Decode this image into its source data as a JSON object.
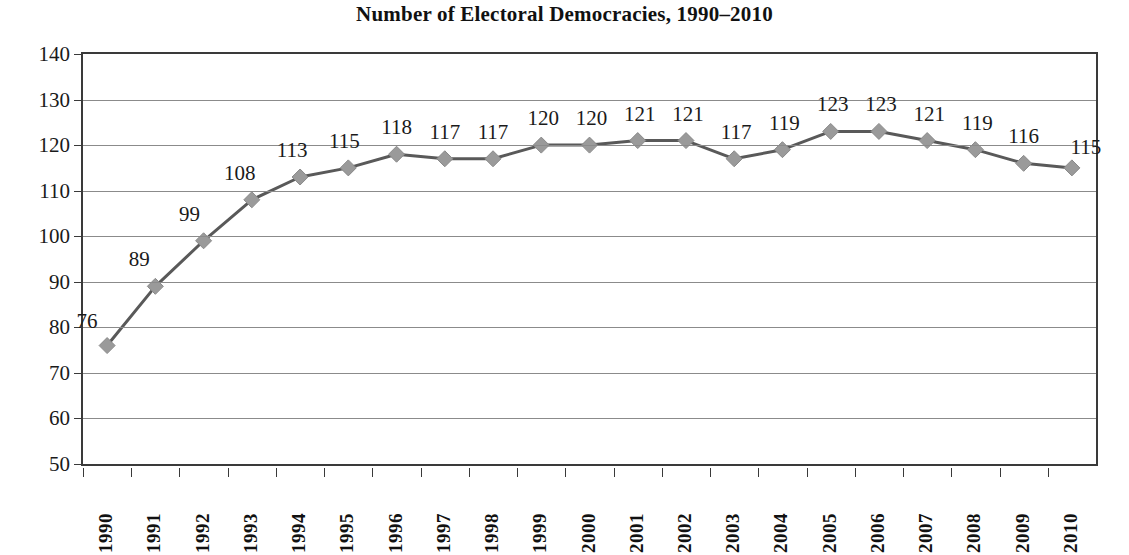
{
  "chart_data": {
    "type": "line",
    "title": "Number of Electoral Democracies, 1990–2010",
    "xlabel": "",
    "ylabel": "",
    "ylim": [
      50,
      140
    ],
    "ytick_step": 10,
    "yticks": [
      140,
      130,
      120,
      110,
      100,
      90,
      80,
      70,
      60,
      50
    ],
    "grid": true,
    "legend": "none",
    "marker": "diamond",
    "categories": [
      "1990",
      "1991",
      "1992",
      "1993",
      "1994",
      "1995",
      "1996",
      "1997",
      "1998",
      "1999",
      "2000",
      "2001",
      "2002",
      "2003",
      "2004",
      "2005",
      "2006",
      "2007",
      "2008",
      "2009",
      "2010"
    ],
    "values": [
      76,
      89,
      99,
      108,
      113,
      115,
      118,
      117,
      117,
      120,
      120,
      121,
      121,
      117,
      119,
      123,
      123,
      121,
      119,
      116,
      115
    ],
    "data_labels": [
      "76",
      "89",
      "99",
      "108",
      "113",
      "115",
      "118",
      "117",
      "117",
      "120",
      "120",
      "121",
      "121",
      "117",
      "119",
      "123",
      "123",
      "121",
      "119",
      "116",
      "115"
    ]
  },
  "colors": {
    "line": "#595959",
    "marker": "#9a9a9a",
    "marker_edge": "#8a8a8a",
    "gridline": "#8b8b8b",
    "axis": "#3a3a3a",
    "text": "#1a1a1a",
    "background": "#ffffff"
  }
}
